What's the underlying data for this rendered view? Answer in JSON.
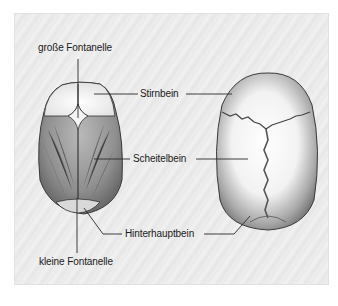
{
  "figure": {
    "labels": {
      "grosse_fontanelle": "große Fontanelle",
      "stirnbein": "Stirnbein",
      "scheitelbein": "Scheitelbein",
      "hinterhauptbein": "Hinterhauptbein",
      "kleine_fontanelle": "kleine Fontanelle"
    },
    "views": [
      {
        "name": "infant-skull-top-view",
        "description": "Säuglingsschädel von oben mit offenen Fontanellen"
      },
      {
        "name": "adult-skull-top-view",
        "description": "Erwachsenenschädel von oben mit geschlossenen Nähten"
      }
    ],
    "colors": {
      "background": "#ececec",
      "bone_light": "#ffffff",
      "bone_shadow": "#8a8a8a",
      "suture": "#333333",
      "leader_line": "#2a2a2a",
      "text": "#1a1a1a"
    }
  }
}
